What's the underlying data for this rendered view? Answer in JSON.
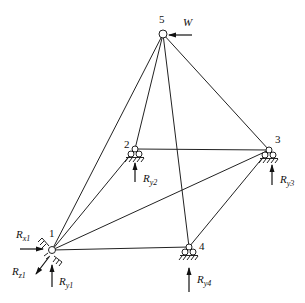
{
  "diagram": {
    "type": "space-truss",
    "stroke_color": "#222222",
    "nodes": [
      {
        "id": "1",
        "label": "1",
        "x": 52,
        "y": 250
      },
      {
        "id": "2",
        "label": "2",
        "x": 135,
        "y": 149
      },
      {
        "id": "3",
        "label": "3",
        "x": 269,
        "y": 150
      },
      {
        "id": "4",
        "label": "4",
        "x": 189,
        "y": 247
      },
      {
        "id": "5",
        "label": "5",
        "x": 163,
        "y": 34
      }
    ],
    "members": [
      [
        "1",
        "5"
      ],
      [
        "1",
        "2"
      ],
      [
        "1",
        "3"
      ],
      [
        "1",
        "4"
      ],
      [
        "2",
        "5"
      ],
      [
        "2",
        "3"
      ],
      [
        "3",
        "5"
      ],
      [
        "4",
        "5"
      ],
      [
        "3",
        "4"
      ]
    ],
    "loads": [
      {
        "node": "5",
        "label": "W",
        "direction": "left"
      }
    ],
    "reactions": [
      {
        "node": "1",
        "main": "R",
        "sub": "x1",
        "direction": "right"
      },
      {
        "node": "1",
        "main": "R",
        "sub": "z1",
        "direction": "down-left"
      },
      {
        "node": "1",
        "main": "R",
        "sub": "y1",
        "direction": "up"
      },
      {
        "node": "2",
        "main": "R",
        "sub": "y2",
        "direction": "up"
      },
      {
        "node": "3",
        "main": "R",
        "sub": "y3",
        "direction": "up"
      },
      {
        "node": "4",
        "main": "R",
        "sub": "y4",
        "direction": "up"
      }
    ]
  }
}
